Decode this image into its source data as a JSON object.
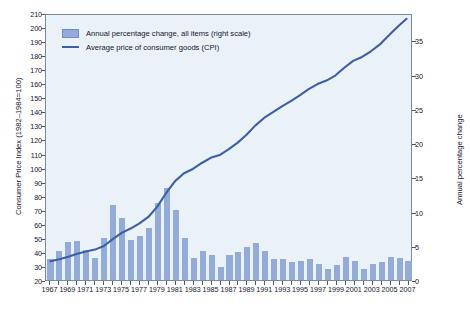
{
  "legend": {
    "position": "top-left",
    "bar_label": "Annual percentage change, all items (right scale)",
    "line_label": "Average price of consumer goods (CPI)",
    "bar_color": "#93abd9",
    "line_color": "#3a5fa8"
  },
  "axes": {
    "left_title": "Consumer Price Index (1982–1984=100)",
    "right_title": "Annual percentage change",
    "left_ticks": [
      20,
      30,
      40,
      50,
      60,
      70,
      80,
      90,
      100,
      110,
      120,
      130,
      140,
      150,
      160,
      170,
      180,
      190,
      200,
      210
    ],
    "right_ticks": [
      0,
      5,
      10,
      15,
      20,
      25,
      30,
      35
    ],
    "x_ticks": [
      1967,
      1969,
      1971,
      1973,
      1975,
      1977,
      1979,
      1981,
      1983,
      1985,
      1987,
      1989,
      1991,
      1993,
      1995,
      1997,
      1999,
      2001,
      2003,
      2005,
      2007
    ]
  },
  "chart_data": {
    "type": "bar",
    "title": "",
    "xlabel": "",
    "ylabel": "Consumer Price Index (1982–1984=100)",
    "y2label": "Annual percentage change",
    "ylim": [
      20,
      210
    ],
    "y2lim": [
      0,
      39
    ],
    "xlim": [
      1966.5,
      2007.5
    ],
    "grid": false,
    "legend": "top-left",
    "categories": [
      1967,
      1968,
      1969,
      1970,
      1971,
      1972,
      1973,
      1974,
      1975,
      1976,
      1977,
      1978,
      1979,
      1980,
      1981,
      1982,
      1983,
      1984,
      1985,
      1986,
      1987,
      1988,
      1989,
      1990,
      1991,
      1992,
      1993,
      1994,
      1995,
      1996,
      1997,
      1998,
      1999,
      2000,
      2001,
      2002,
      2003,
      2004,
      2005,
      2006,
      2007
    ],
    "series": [
      {
        "name": "Annual percentage change, all items (right scale)",
        "type": "bar",
        "axis": "right",
        "color": "#93abd9",
        "values": [
          3.1,
          4.2,
          5.5,
          5.7,
          4.4,
          3.2,
          6.2,
          11.0,
          9.1,
          5.8,
          6.5,
          7.6,
          11.3,
          13.5,
          10.3,
          6.2,
          3.2,
          4.3,
          3.6,
          1.9,
          3.6,
          4.1,
          4.8,
          5.4,
          4.2,
          3.0,
          3.0,
          2.6,
          2.8,
          3.0,
          2.3,
          1.6,
          2.2,
          3.4,
          2.8,
          1.6,
          2.3,
          2.7,
          3.4,
          3.2,
          2.8
        ]
      },
      {
        "name": "Average price of consumer goods (CPI)",
        "type": "line",
        "axis": "left",
        "color": "#3a5fa8",
        "values": [
          33.4,
          34.8,
          36.7,
          38.8,
          40.5,
          41.8,
          44.4,
          49.3,
          53.8,
          56.9,
          60.6,
          65.2,
          72.6,
          82.4,
          90.9,
          96.5,
          99.6,
          103.9,
          107.6,
          109.6,
          113.6,
          118.3,
          124.0,
          130.7,
          136.2,
          140.3,
          144.5,
          148.2,
          152.4,
          156.9,
          160.5,
          163.0,
          166.6,
          172.2,
          177.1,
          179.9,
          184.0,
          188.9,
          195.3,
          201.6,
          207.3
        ]
      }
    ]
  }
}
